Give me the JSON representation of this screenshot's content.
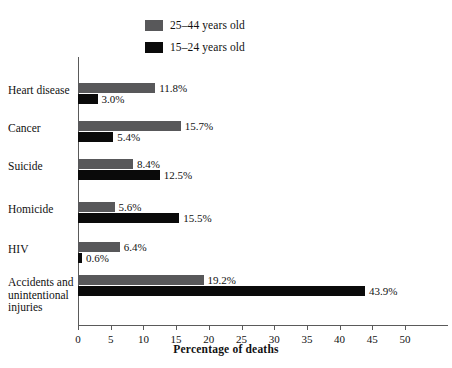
{
  "chart_data": {
    "type": "bar",
    "orientation": "horizontal",
    "title": "",
    "xlabel": "Percentage of deaths",
    "ylabel": "",
    "xlim": [
      0,
      50
    ],
    "xticks": [
      0,
      5,
      10,
      15,
      20,
      25,
      30,
      35,
      40,
      45,
      50
    ],
    "grid": false,
    "legend_position": "top-center",
    "categories": [
      "Heart disease",
      "Cancer",
      "Suicide",
      "Homicide",
      "HIV",
      "Accidents and\nunintentional\ninjuries"
    ],
    "series": [
      {
        "name": "25–44 years old",
        "color": "#58585a",
        "values": [
          11.8,
          15.7,
          8.4,
          5.6,
          6.4,
          19.2
        ],
        "labels": [
          "11.8%",
          "15.7%",
          "8.4%",
          "5.6%",
          "6.4%",
          "19.2%"
        ]
      },
      {
        "name": "15–24 years old",
        "color": "#0a0a0a",
        "values": [
          3.0,
          5.4,
          12.5,
          15.5,
          0.6,
          43.9
        ],
        "labels": [
          "3.0%",
          "5.4%",
          "12.5%",
          "15.5%",
          "0.6%",
          "43.9%"
        ]
      }
    ]
  },
  "legend": {
    "items": [
      {
        "label": "25–44 years old",
        "color": "#58585a"
      },
      {
        "label": "15–24 years old",
        "color": "#0a0a0a"
      }
    ]
  },
  "axis": {
    "x_title": "Percentage of deaths",
    "tick_labels": [
      "0",
      "5",
      "10",
      "15",
      "20",
      "25",
      "30",
      "35",
      "40",
      "45",
      "50"
    ]
  }
}
